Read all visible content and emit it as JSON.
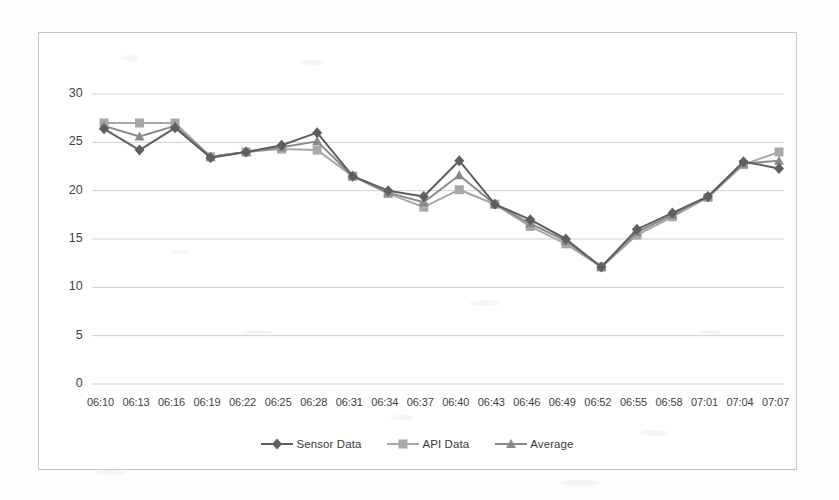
{
  "chart_data": {
    "type": "line",
    "title": "",
    "xlabel": "",
    "ylabel": "",
    "ylim": [
      0,
      30
    ],
    "yticks": [
      0,
      5,
      10,
      15,
      20,
      25,
      30
    ],
    "grid": true,
    "legend_position": "bottom",
    "categories": [
      "06:10",
      "06:13",
      "06:16",
      "06:19",
      "06:22",
      "06:25",
      "06:28",
      "06:31",
      "06:34",
      "06:37",
      "06:40",
      "06:43",
      "06:46",
      "06:49",
      "06:52",
      "06:55",
      "06:58",
      "07:01",
      "07:04",
      "07:07"
    ],
    "series": [
      {
        "name": "Sensor Data",
        "marker": "diamond",
        "color": "#5f5f5f",
        "values": [
          26.4,
          24.2,
          26.5,
          23.4,
          24.0,
          24.7,
          26.0,
          21.5,
          20.0,
          19.4,
          23.1,
          18.6,
          17.0,
          15.0,
          12.1,
          16.0,
          17.7,
          19.4,
          23.0,
          22.3
        ]
      },
      {
        "name": "API Data",
        "marker": "square",
        "color": "#a8a8a8",
        "values": [
          27.0,
          27.0,
          27.0,
          23.5,
          24.0,
          24.3,
          24.2,
          21.5,
          19.7,
          18.3,
          20.1,
          18.6,
          16.3,
          14.5,
          12.1,
          15.4,
          17.3,
          19.3,
          22.7,
          24.0
        ]
      },
      {
        "name": "Average",
        "marker": "triangle",
        "color": "#8a8a8a",
        "values": [
          26.7,
          25.6,
          26.7,
          23.5,
          24.0,
          24.5,
          25.1,
          21.5,
          19.8,
          18.8,
          21.6,
          18.6,
          16.6,
          14.8,
          12.1,
          15.7,
          17.5,
          19.4,
          22.8,
          23.1
        ]
      }
    ]
  },
  "legend": {
    "items": [
      {
        "label": "Sensor Data"
      },
      {
        "label": "API Data"
      },
      {
        "label": "Average"
      }
    ]
  }
}
